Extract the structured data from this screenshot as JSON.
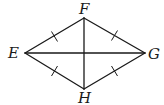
{
  "diagram": {
    "vertices": [
      {
        "name": "E",
        "x": 25,
        "y": 53,
        "label_x": 13,
        "label_y": 58
      },
      {
        "name": "F",
        "x": 84,
        "y": 18,
        "label_x": 84,
        "label_y": 13
      },
      {
        "name": "G",
        "x": 145,
        "y": 53,
        "label_x": 152,
        "label_y": 59
      },
      {
        "name": "H",
        "x": 84,
        "y": 89,
        "label_x": 85,
        "label_y": 103
      }
    ],
    "sides": [
      {
        "from": "E",
        "to": "F",
        "tick_marks": 1
      },
      {
        "from": "F",
        "to": "G",
        "tick_marks": 1
      },
      {
        "from": "G",
        "to": "H",
        "tick_marks": 1
      },
      {
        "from": "H",
        "to": "E",
        "tick_marks": 1
      }
    ],
    "diagonals": [
      {
        "from": "E",
        "to": "G"
      },
      {
        "from": "F",
        "to": "H"
      }
    ],
    "labels": {
      "E": "E",
      "F": "F",
      "G": "G",
      "H": "H"
    },
    "colors": {
      "stroke": "#1a1a1a",
      "background": "#ffffff"
    }
  }
}
